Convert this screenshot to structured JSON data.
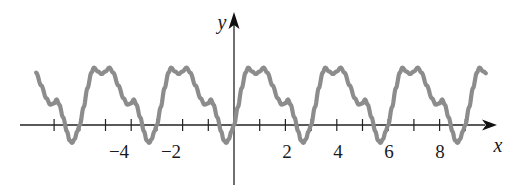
{
  "chart_data": {
    "type": "line",
    "title": "",
    "xlabel": "x",
    "ylabel": "y",
    "x_tick_labels": [
      "-4",
      "-2",
      "2",
      "4",
      "6",
      "8"
    ],
    "x_ticks": [
      -7,
      -6,
      -5,
      -4,
      -3,
      -2,
      -1,
      1,
      2,
      3,
      4,
      5,
      6,
      7,
      8,
      9
    ],
    "xlim": [
      -8.2,
      10.0
    ],
    "ylim": [
      -4.3,
      3.2
    ],
    "grid": false,
    "period": 3,
    "series": [
      {
        "name": "y = f(x) (periodic, period 3)",
        "color": "#8c8c8c",
        "one_period_points": [
          [
            0.0,
            0.0
          ],
          [
            0.15,
            0.7
          ],
          [
            0.3,
            1.45
          ],
          [
            0.45,
            2.05
          ],
          [
            0.55,
            2.25
          ],
          [
            0.7,
            2.1
          ],
          [
            0.85,
            2.0
          ],
          [
            1.0,
            2.1
          ],
          [
            1.15,
            2.25
          ],
          [
            1.3,
            2.05
          ],
          [
            1.5,
            1.55
          ],
          [
            1.7,
            1.05
          ],
          [
            1.85,
            0.8
          ],
          [
            2.0,
            0.85
          ],
          [
            2.1,
            1.0
          ],
          [
            2.2,
            0.8
          ],
          [
            2.35,
            0.3
          ],
          [
            2.5,
            -0.25
          ],
          [
            2.6,
            -0.6
          ],
          [
            2.7,
            -0.7
          ],
          [
            2.8,
            -0.55
          ],
          [
            2.9,
            -0.25
          ],
          [
            3.0,
            0.0
          ]
        ],
        "x_range": [
          -7.7,
          9.8
        ]
      }
    ]
  },
  "labels": {
    "x_axis": "x",
    "y_axis": "y",
    "tick_m4": "−4",
    "tick_m2": "−2",
    "tick_2": "2",
    "tick_4": "4",
    "tick_6": "6",
    "tick_8": "8"
  }
}
